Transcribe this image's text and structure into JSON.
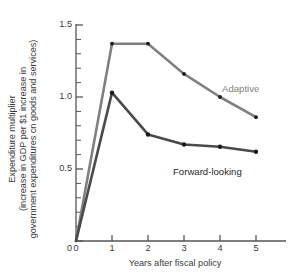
{
  "axes": {
    "ylabel_lines": [
      "Expenditure multiplier",
      "(increase in GDP per $1 increase in",
      "government expenditures cn goods and services)"
    ],
    "xlabel": "Years after fiscal policy",
    "ytick_labels": [
      "0",
      "0.5",
      "1.0",
      "1.5"
    ],
    "xtick_labels": [
      "0",
      "1",
      "2",
      "3",
      "4",
      "5"
    ]
  },
  "series_labels": {
    "adaptive": "Adaptive",
    "forward_looking": "Forward-looking"
  },
  "colors": {
    "adaptive": "#808080",
    "forward_looking": "#4a4a4a",
    "axis": "#555555",
    "marker": "#1a1a1a",
    "text": "#3a3a3a"
  },
  "chart_data": {
    "type": "line",
    "title": "",
    "xlabel": "Years after fiscal policy",
    "ylabel": "Expenditure multiplier (increase in GDP per $1 increase in government expenditures cn goods and services)",
    "x": [
      0,
      1,
      2,
      3,
      4,
      5
    ],
    "xlim": [
      0,
      5.6
    ],
    "ylim": [
      0,
      1.58
    ],
    "xticks": [
      0,
      1,
      2,
      3,
      4,
      5
    ],
    "yticks": [
      0,
      0.5,
      1.0,
      1.5
    ],
    "yminorticks": [
      0.1,
      0.2,
      0.3,
      0.4,
      0.6,
      0.7,
      0.8,
      0.9,
      1.1,
      1.2,
      1.3,
      1.4
    ],
    "grid": false,
    "legend": "inline-annotations",
    "series": [
      {
        "name": "Adaptive",
        "color": "#808080",
        "values": [
          0,
          1.37,
          1.37,
          1.16,
          1.0,
          0.86
        ]
      },
      {
        "name": "Forward-looking",
        "color": "#4a4a4a",
        "values": [
          0,
          1.03,
          0.74,
          0.67,
          0.655,
          0.62
        ]
      }
    ],
    "annotations": [
      {
        "text": "Adaptive",
        "x": 3.9,
        "y": 1.07
      },
      {
        "text": "Forward-looking",
        "x": 4.6,
        "y": 0.5
      }
    ]
  }
}
